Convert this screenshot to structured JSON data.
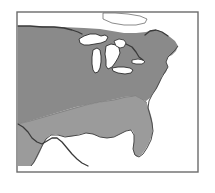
{
  "figure": {
    "kind": "thematic-map",
    "region": "Eastern and Central United States",
    "title": "",
    "caption": "",
    "background_color": "#ffffff"
  },
  "frame": {
    "x": 17,
    "y": 12,
    "width": 181,
    "height": 160,
    "stroke_color": "#6b6b6b",
    "stroke_width": 1.4,
    "fill_color": "#ffffff"
  },
  "legend": {
    "visible": false,
    "entries": []
  },
  "labels": [],
  "shading": {
    "zones": [
      {
        "name": "northern-zone",
        "description": "Darker gray shaded land area covering the northern and central states",
        "color": "#8a8a8a"
      },
      {
        "name": "southern-zone",
        "description": "Lighter gray shaded land area covering the southern states",
        "color": "#9b9b9b"
      }
    ],
    "water_color": "#ffffff",
    "boundary_line_color": "#3a3a3a",
    "coast_line_color": "#4a4a4a",
    "lake_outline_color": "#2e2e2e"
  },
  "features": {
    "water_bodies": [
      "Lake Superior",
      "Lake Michigan",
      "Lake Huron",
      "Lake Erie",
      "Lake Ontario",
      "Georgian Bay",
      "Atlantic Ocean",
      "Gulf of Mexico"
    ],
    "borders": [
      "United States - Canada border",
      "United States - Mexico border"
    ],
    "coastlines": [
      "Atlantic coast",
      "Gulf coast",
      "Florida peninsula"
    ]
  },
  "geometry": {
    "land_north": "M 18,26 L 40,26 L 62,27 L 84,28 L 100,29 L 112,31 L 124,33 L 136,33 L 146,32 L 152,30 L 158,30 L 164,33 L 170,37 L 175,41 L 178,46 L 176,51 L 172,55 L 168,57 L 166,62 L 168,67 L 166,72 L 162,76 L 160,82 L 157,88 L 153,93 L 150,98 L 146,101 L 142,100 L 138,97 L 132,96 L 124,97 L 116,99 L 106,101 L 96,103 L 86,105 L 76,107 L 66,110 L 56,113 L 46,116 L 36,119 L 26,122 L 18,124 Z",
    "land_south": "M 18,124 L 26,122 L 36,119 L 46,116 L 56,113 L 66,110 L 76,107 L 86,105 L 96,103 L 106,101 L 116,99 L 124,97 L 132,96 L 138,97 L 142,100 L 146,101 L 148,106 L 150,112 L 152,119 L 153,127 L 152,135 L 149,143 L 145,150 L 141,155 L 137,157 L 134,154 L 133,148 L 134,141 L 134,134 L 132,130 L 128,130 L 122,133 L 116,136 L 110,138 L 104,138 L 98,136 L 92,134 L 86,133 L 80,134 L 74,136 L 68,137 L 62,136 L 56,134 L 50,135 L 46,139 L 43,145 L 40,152 L 37,158 L 34,163 L 31,166 L 18,166 Z",
    "lake_superior": "M 79,39 L 84,36 L 90,34 L 96,34 L 101,36 L 105,35 L 108,37 L 106,41 L 101,43 L 95,44 L 89,45 L 84,45 L 80,43 Z",
    "lake_michigan": "M 93,50 L 97,48 L 100,50 L 101,56 L 101,62 L 100,68 L 98,72 L 95,73 L 93,70 L 92,64 L 92,57 Z",
    "lake_huron": "M 106,46 L 111,44 L 116,45 L 119,48 L 120,53 L 118,58 L 115,63 L 112,67 L 108,69 L 106,66 L 106,60 L 105,54 Z",
    "lake_georgian_bay": "M 114,41 L 119,39 L 124,40 L 126,43 L 124,47 L 120,48 L 116,46 Z",
    "lake_erie": "M 112,68 L 118,67 L 124,67 L 130,68 L 133,70 L 131,73 L 125,74 L 118,73 L 113,71 Z",
    "lake_ontario": "M 132,60 L 138,59 L 143,60 L 145,62 L 142,64 L 136,64 L 132,63 Z",
    "top_white_bay": "M 103,13 L 115,13 L 128,14 L 140,16 L 147,19 L 145,23 L 136,25 L 124,25 L 112,23 L 103,19 Z",
    "canada_border": "M 18,26 L 30,26 L 42,27 L 54,27 L 64,28 L 72,30 L 78,32 L 82,34 M 126,44 L 132,47 L 136,52 L 139,57 L 143,60 M 145,35 L 150,31 L 156,30 L 162,32 L 168,36",
    "mexico_border": "M 18,124 L 23,127 L 28,132 L 32,138 L 37,142 L 42,144 L 47,141 L 52,138 L 57,138 L 62,142 L 67,148 L 72,154 L 77,159 L 82,163 L 88,166",
    "atlantic_coast": "M 178,46 L 175,50 L 171,54 L 168,57 L 166,62 L 168,67 L 165,72 L 162,77 L 159,83 L 156,89 L 152,95 L 149,101 L 148,108 L 150,115 L 152,123 L 153,131 L 151,140 L 147,148 L 143,154 L 139,157",
    "gulf_coast": "M 139,157 L 135,155 L 133,149 L 134,142 L 134,135 L 131,130 L 126,131 L 120,134 L 114,137 L 107,138 L 100,137 L 93,134 L 86,133 L 79,135 L 72,136 L 65,137 L 58,135 L 51,135 L 46,139 L 42,146 L 38,154 L 34,162 L 31,166"
  },
  "palette": {
    "dark_gray": "#8a8a8a",
    "light_gray": "#9b9b9b",
    "white": "#ffffff",
    "frame": "#6b6b6b",
    "line_dark": "#3a3a3a"
  }
}
